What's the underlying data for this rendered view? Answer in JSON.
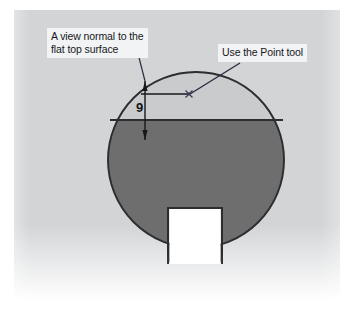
{
  "figure": {
    "name": "cad-part-drawing",
    "background_color": "#ffffff",
    "canvas_color": "#d2d4d6"
  },
  "annotations": {
    "view_normal": {
      "line1": "A view normal to the",
      "line2": "flat top surface"
    },
    "point_tool": {
      "label": "Use the Point tool"
    }
  },
  "dimension": {
    "value": "9",
    "label": "9"
  },
  "part": {
    "shape": "circle-with-flat-top-and-bottom-keyway",
    "body_color": "#6e6e6e",
    "top_segment_color": "#c9cbcd",
    "outline_color": "#2b2d30",
    "circle": {
      "center_x": 196,
      "center_y": 160,
      "radius": 88
    },
    "flat_top_chord_y": 120,
    "keyway": {
      "left_x": 168,
      "right_x": 222,
      "top_y": 208
    }
  },
  "point_marker": {
    "name": "sketch-point",
    "x": 189,
    "y": 94
  },
  "colors": {
    "callout_background": "#f2f3f4",
    "text": "#16181c",
    "leader_line": "#2a2d40"
  }
}
